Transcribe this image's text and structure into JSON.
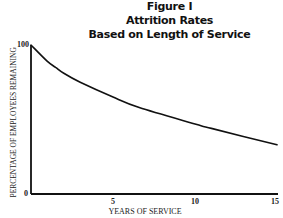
{
  "chart_data": {
    "type": "line",
    "title": "Figure I",
    "subtitle": [
      "Attrition Rates",
      "Based on Length of Service"
    ],
    "xlabel": "YEARS OF SERVICE",
    "ylabel": "PERCENTAGE OF EMPLOYEES REMAINING",
    "x_ticks": [
      "5",
      "10",
      "15"
    ],
    "y_ticks": [
      "0",
      "100"
    ],
    "xlim": [
      0,
      15
    ],
    "ylim": [
      0,
      100
    ],
    "grid": false,
    "legend": null,
    "series": [
      {
        "name": "Employees remaining (%)",
        "x": [
          0,
          1,
          1.5,
          2,
          3,
          5,
          6.6,
          10,
          11,
          15
        ],
        "values": [
          100,
          89,
          85,
          81,
          75,
          65,
          58,
          47,
          44,
          33
        ]
      }
    ]
  },
  "header": {
    "line1": "Figure I",
    "line2": "Attrition Rates",
    "line3": "Based on Length of Service"
  },
  "axes": {
    "ylabel": "PERCENTAGE OF EMPLOYEES REMAINING",
    "xlabel": "YEARS OF SERVICE",
    "y_top": "100",
    "y_bottom": "0",
    "x5": "5",
    "x10": "10",
    "x15": "15"
  },
  "colors": {
    "line": "#111111",
    "axis": "#111111",
    "background": "#ffffff"
  }
}
